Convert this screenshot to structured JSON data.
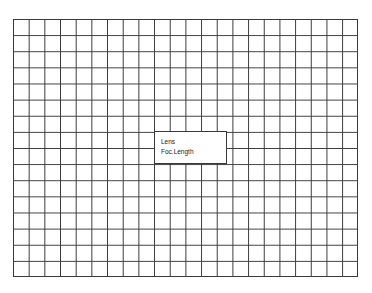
{
  "grid": {
    "columns": 22,
    "rows": 16,
    "line_color": "#3a3a3a",
    "background": "#ffffff"
  },
  "info_box": {
    "lines": [
      "Lens",
      "Foc.Length"
    ]
  }
}
